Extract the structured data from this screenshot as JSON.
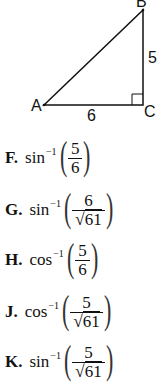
{
  "figure": {
    "vertices": {
      "A": "A",
      "B": "B",
      "C": "C"
    },
    "side_AC": "6",
    "side_BC": "5",
    "right_angle_at": "C"
  },
  "choices": [
    {
      "letter": "F.",
      "func": "sin",
      "exp": "−1",
      "numerator": "5",
      "denominator": "6",
      "radical": false
    },
    {
      "letter": "G.",
      "func": "sin",
      "exp": "−1",
      "numerator": "6",
      "denominator": "61",
      "radical": true
    },
    {
      "letter": "H.",
      "func": "cos",
      "exp": "−1",
      "numerator": "5",
      "denominator": "6",
      "radical": false
    },
    {
      "letter": "J.",
      "func": "cos",
      "exp": "−1",
      "numerator": "5",
      "denominator": "61",
      "radical": true
    },
    {
      "letter": "K.",
      "func": "sin",
      "exp": "−1",
      "numerator": "5",
      "denominator": "61",
      "radical": true
    }
  ]
}
